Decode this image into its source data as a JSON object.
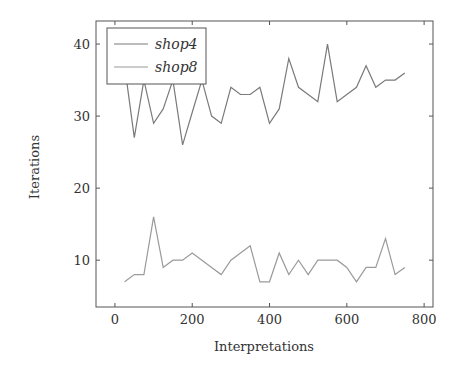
{
  "chart_data": {
    "type": "line",
    "title": "",
    "xlabel": "Interpretations",
    "ylabel": "Iterations",
    "xlim": [
      -49,
      823
    ],
    "ylim": [
      3.5,
      43.2
    ],
    "xticks": [
      0,
      200,
      400,
      600,
      800
    ],
    "yticks": [
      10,
      20,
      30,
      40
    ],
    "xtick_labels": [
      "0",
      "200",
      "400",
      "600",
      "800"
    ],
    "ytick_labels": [
      "10",
      "20",
      "30",
      "40"
    ],
    "grid": false,
    "legend_position": "top-left",
    "x": [
      25,
      50,
      75,
      100,
      125,
      150,
      175,
      200,
      225,
      250,
      275,
      300,
      325,
      350,
      375,
      400,
      425,
      450,
      475,
      500,
      525,
      550,
      575,
      600,
      625,
      650,
      675,
      700,
      725,
      750
    ],
    "series": [
      {
        "name": "shop4",
        "color": "#7a7a7a",
        "values": [
          37,
          27,
          35,
          29,
          31,
          35,
          26,
          30.5,
          35,
          30,
          29,
          34,
          33,
          33,
          34,
          29,
          31,
          38,
          34,
          33,
          32,
          40,
          32,
          33,
          34,
          37,
          34,
          35,
          35,
          36
        ]
      },
      {
        "name": "shop8",
        "color": "#9a9a9a",
        "values": [
          7,
          8,
          8,
          16,
          9,
          10,
          10,
          11,
          10,
          9,
          8,
          10,
          11,
          12,
          7,
          7,
          11,
          8,
          10,
          8,
          10,
          10,
          10,
          9,
          7,
          9,
          9,
          13,
          8,
          9
        ]
      }
    ]
  }
}
